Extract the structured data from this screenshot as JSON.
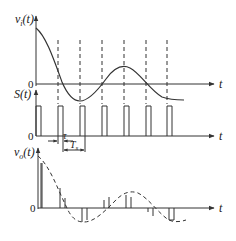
{
  "diagram": {
    "plots": [
      {
        "id": "input",
        "y_label": "v",
        "y_label_sub": "i",
        "y_label_arg": "(t)",
        "zero_label": "0",
        "x_label": "t",
        "curve": "decaying oscillation settling to a constant level"
      },
      {
        "id": "sampling",
        "y_label": "S(t)",
        "zero_label": "0",
        "x_label": "t",
        "pulse_count": 7,
        "annotations": {
          "pulse_width_label": "τ",
          "period_label": "T",
          "period_label_sub": "s"
        }
      },
      {
        "id": "output",
        "y_label": "v",
        "y_label_sub": "o",
        "y_label_arg": "(t)",
        "zero_label": "0",
        "x_label": "t",
        "curve": "dashed envelope with sampled pulses"
      }
    ],
    "colors": {
      "line": "#333333",
      "background": "#ffffff"
    }
  }
}
